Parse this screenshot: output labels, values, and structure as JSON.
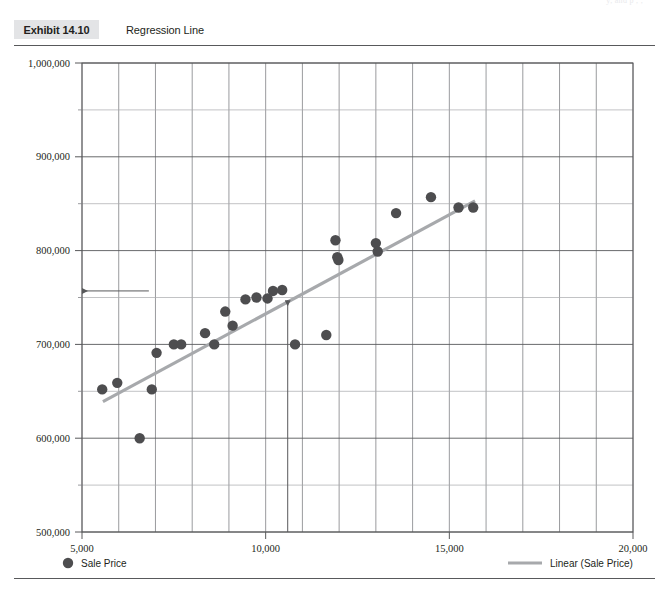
{
  "page": {
    "running_head": "y, and p  ,  ,"
  },
  "exhibit": {
    "tag": "Exhibit 14.10",
    "caption": "Regression Line"
  },
  "legend": {
    "series_label": "Sale Price",
    "trend_label": "Linear (Sale Price)",
    "marker_color": "#4d4d4f",
    "trend_color": "#a7a9ac"
  },
  "chart_data": {
    "type": "scatter",
    "title": "Regression Line",
    "xlabel": "",
    "ylabel": "",
    "xlim": [
      5000,
      20000
    ],
    "ylim": [
      500000,
      1000000
    ],
    "xticks": [
      5000,
      10000,
      15000,
      20000
    ],
    "xtick_labels": [
      "5,000",
      "10,000",
      "15,000",
      "20,000"
    ],
    "yticks": [
      500000,
      600000,
      700000,
      800000,
      900000,
      1000000
    ],
    "ytick_labels": [
      "500,000",
      "600,000",
      "700,000",
      "800,000",
      "900,000",
      "1,000,000"
    ],
    "x_minor_step": 1000,
    "y_minor_step": 50000,
    "grid": true,
    "legend_position": "bottom",
    "series": [
      {
        "name": "Sale Price",
        "type": "scatter",
        "color": "#4d4d4f",
        "points": [
          [
            5550,
            652000
          ],
          [
            5960,
            659000
          ],
          [
            6570,
            600000
          ],
          [
            6900,
            652000
          ],
          [
            7030,
            691000
          ],
          [
            7500,
            700000
          ],
          [
            7700,
            700000
          ],
          [
            8350,
            712000
          ],
          [
            8600,
            700000
          ],
          [
            8900,
            735000
          ],
          [
            9100,
            720000
          ],
          [
            9450,
            748000
          ],
          [
            9750,
            750000
          ],
          [
            10050,
            749000
          ],
          [
            10200,
            757000
          ],
          [
            10450,
            758000
          ],
          [
            10800,
            700000
          ],
          [
            11650,
            710000
          ],
          [
            11900,
            811000
          ],
          [
            11950,
            793000
          ],
          [
            11980,
            790000
          ],
          [
            13000,
            808000
          ],
          [
            13050,
            799000
          ],
          [
            13550,
            840000
          ],
          [
            14500,
            857000
          ],
          [
            15250,
            846000
          ],
          [
            15650,
            846000
          ]
        ]
      },
      {
        "name": "Linear (Sale Price)",
        "type": "line",
        "color": "#a7a9ac",
        "fit": "linear",
        "endpoints": [
          [
            5570,
            639000
          ],
          [
            15700,
            853000
          ]
        ]
      }
    ],
    "annotations": [
      {
        "name": "predicted-y-arrow",
        "type": "arrow",
        "direction": "left",
        "from": [
          6820,
          757000
        ],
        "to": [
          5000,
          757000
        ]
      },
      {
        "name": "input-x-arrow",
        "type": "arrow",
        "direction": "up",
        "from": [
          10600,
          500000
        ],
        "to": [
          10600,
          747000
        ]
      }
    ]
  }
}
